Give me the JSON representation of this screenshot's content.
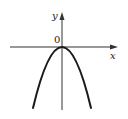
{
  "figure": {
    "type": "function-graph",
    "axes": {
      "x_label": "x",
      "y_label": "y",
      "origin_label": "0"
    },
    "curve": {
      "shape": "parabola",
      "opens": "down",
      "vertex": [
        0,
        0
      ],
      "color": "#1a1a1a"
    },
    "axis_color": "#333333"
  }
}
